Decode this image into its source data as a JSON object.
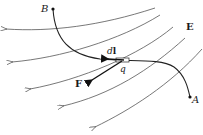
{
  "diagram": {
    "labels": {
      "point_start": "A",
      "point_end": "B",
      "field": "E",
      "force": "F",
      "displacement_d": "d",
      "displacement_l": "l",
      "charge": "q"
    },
    "colors": {
      "field_lines": "#555555",
      "path": "#222222",
      "vectors": "#111111",
      "text": "#1a1a1a",
      "background": "#ffffff"
    },
    "field_line_count": 6
  }
}
